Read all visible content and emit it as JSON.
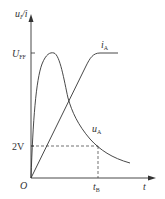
{
  "diagram": {
    "type": "waveform",
    "y_axis_label": {
      "main": "u",
      "sub": "I",
      "sep": "/",
      "rest": "i"
    },
    "x_axis_label": "t",
    "origin_label": "O",
    "y_ticks": [
      {
        "label_main": "U",
        "label_sub": "FF",
        "level": "U_FF"
      },
      {
        "label_main": "2V",
        "label_sub": "",
        "level": "2V"
      }
    ],
    "x_ticks": [
      {
        "label_main": "t",
        "label_sub": "B"
      }
    ],
    "curves": [
      {
        "name": "i_A",
        "label_main": "i",
        "label_sub": "A",
        "description": "rises linearly from origin, then saturates at U_FF level"
      },
      {
        "name": "u_A",
        "label_main": "u",
        "label_sub": "A",
        "description": "rises quickly to peak at U_FF, then decays exponentially, crossing 2V at t_B"
      }
    ],
    "colors": {
      "line": "#333333",
      "background": "#ffffff"
    }
  }
}
